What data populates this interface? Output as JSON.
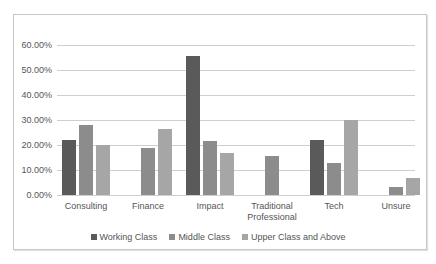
{
  "chart_data": {
    "type": "bar",
    "title": "",
    "xlabel": "",
    "ylabel": "",
    "ylim": [
      0,
      0.6
    ],
    "yticks": [
      "0.00%",
      "10.00%",
      "20.00%",
      "30.00%",
      "40.00%",
      "50.00%",
      "60.00%"
    ],
    "grid": true,
    "legend_position": "bottom",
    "categories": [
      "Consulting",
      "Finance",
      "Impact",
      "Traditional Professional",
      "Tech",
      "Unsure"
    ],
    "category_lines": [
      [
        "Consulting"
      ],
      [
        "Finance"
      ],
      [
        "Impact"
      ],
      [
        "Traditional",
        "Professional"
      ],
      [
        "Tech"
      ],
      [
        "Unsure"
      ]
    ],
    "series": [
      {
        "name": "Working Class",
        "color": "#5a5a5a",
        "values": [
          22.2,
          0,
          55.6,
          0,
          22.2,
          0
        ]
      },
      {
        "name": "Middle Class",
        "color": "#8c8c8c",
        "values": [
          28.0,
          18.7,
          21.7,
          15.6,
          12.7,
          3.3
        ]
      },
      {
        "name": "Upper Class and Above",
        "color": "#a6a6a6",
        "values": [
          20.0,
          26.5,
          16.7,
          0,
          30.0,
          6.9
        ]
      }
    ]
  }
}
